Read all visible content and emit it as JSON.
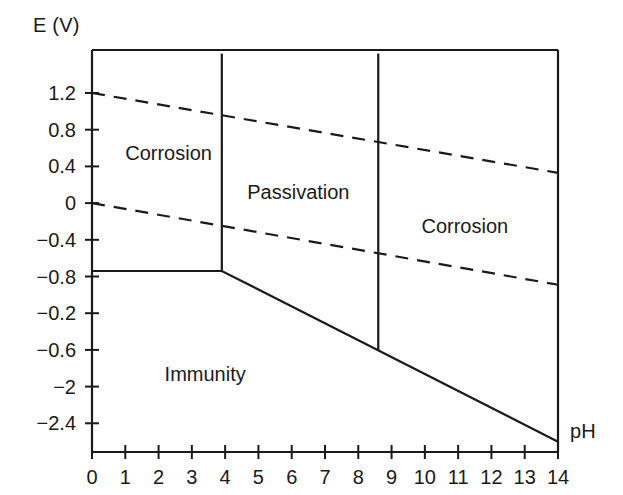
{
  "chart_data": {
    "type": "line",
    "title": "",
    "xlabel": "pH",
    "ylabel": "E (V)",
    "xlim": [
      0,
      14
    ],
    "grid": false,
    "legend": "none",
    "x_tick_labels": [
      "0",
      "1",
      "2",
      "3",
      "4",
      "5",
      "6",
      "7",
      "8",
      "9",
      "10",
      "11",
      "12",
      "13",
      "14"
    ],
    "y_tick_labels": [
      "1.2",
      "0.8",
      "0.4",
      "0",
      "−0.4",
      "−0.8",
      "−0.2",
      "−0.6",
      "−2",
      "−2.4"
    ],
    "series": [
      {
        "name": "upper-water-stability-line",
        "style": "dashed",
        "points": [
          [
            0,
            1.2
          ],
          [
            14,
            0.33
          ]
        ]
      },
      {
        "name": "lower-water-stability-line",
        "style": "dashed",
        "points": [
          [
            0,
            0.0
          ],
          [
            14,
            -0.89
          ]
        ]
      },
      {
        "name": "immunity-boundary",
        "style": "solid",
        "points": [
          [
            0,
            -0.74
          ],
          [
            3.9,
            -0.74
          ],
          [
            14,
            -2.6
          ]
        ]
      },
      {
        "name": "corrosion-passivation-divider",
        "style": "solid",
        "points": [
          [
            3.9,
            1.63
          ],
          [
            3.9,
            -0.74
          ]
        ]
      },
      {
        "name": "passivation-corrosion-divider",
        "style": "solid",
        "points": [
          [
            8.6,
            1.63
          ],
          [
            8.6,
            -1.6
          ]
        ]
      }
    ],
    "region_labels": [
      {
        "text": "Corrosion",
        "ph": 2.3,
        "e": 0.55
      },
      {
        "text": "Passivation",
        "ph": 6.2,
        "e": 0.12
      },
      {
        "text": "Corrosion",
        "ph": 11.2,
        "e": -0.25
      },
      {
        "text": "Immunity",
        "ph": 3.4,
        "e": -1.86
      }
    ]
  },
  "colors": {
    "ink": "#1a1a1a",
    "background": "#ffffff"
  }
}
